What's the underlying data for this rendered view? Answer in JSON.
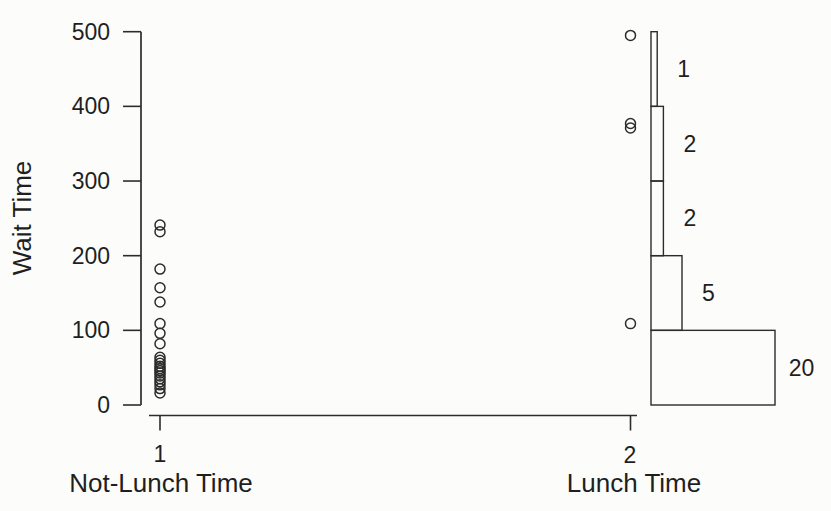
{
  "figure": {
    "background": "#fcfcfa",
    "ink_color": "#2c2c2c",
    "text_color": "#1f1f1f"
  },
  "chart_data": {
    "type": "scatter",
    "title": "",
    "xlabel": "",
    "ylabel": "Wait Time",
    "ylim": [
      0,
      500
    ],
    "yticks": [
      500,
      400,
      300,
      200,
      100,
      0
    ],
    "grid": false,
    "legend": "none",
    "marker": "open-circle",
    "groups": [
      {
        "x": 1,
        "tick_label": "1",
        "axis_label": "Not-Lunch Time",
        "wait_times": [
          241,
          232,
          182,
          157,
          138,
          109,
          96,
          82,
          64,
          60,
          56,
          52,
          49,
          46,
          43,
          39,
          35,
          31,
          27,
          22,
          16
        ]
      },
      {
        "x": 2,
        "tick_label": "2",
        "axis_label": "Lunch Time",
        "wait_times": [
          495,
          377,
          371,
          109
        ]
      }
    ],
    "lunch_histogram": {
      "description": "sideways histogram attached at right of Lunch Time group; bar width proportional to count",
      "bins": [
        {
          "range": [
            400,
            500
          ],
          "count": 1
        },
        {
          "range": [
            300,
            400
          ],
          "count": 2
        },
        {
          "range": [
            200,
            300
          ],
          "count": 2
        },
        {
          "range": [
            100,
            200
          ],
          "count": 5
        },
        {
          "range": [
            0,
            100
          ],
          "count": 20
        }
      ]
    }
  }
}
